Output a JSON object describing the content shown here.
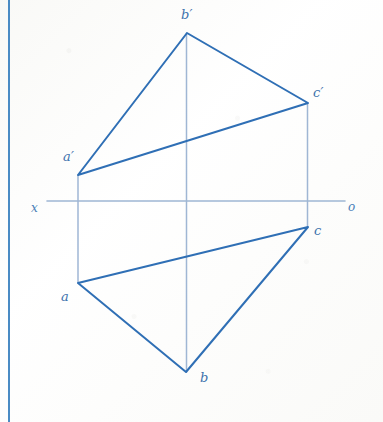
{
  "drawing": {
    "title": "Orthographic projection of triangle ABC",
    "background_color": "#fdfdfc",
    "stroke_color": "#2f6fb5",
    "light_stroke_color": "#9fb6d4",
    "margin_line_color": "#4a8bc4",
    "label_color": "#3d72ad"
  },
  "margin": {
    "line": {
      "x": 9,
      "y1": 0,
      "y2": 422,
      "width": 2,
      "color": "#4a8bc4"
    }
  },
  "axis": {
    "name": "ground-line",
    "x1": 47,
    "y1": 201,
    "x2": 345,
    "y2": 201,
    "color": "#9fb6d4",
    "width": 1.6,
    "left_label": "x",
    "right_label": "o",
    "left_label_pos": {
      "x": 31,
      "y": 202
    },
    "right_label_pos": {
      "x": 348,
      "y": 201
    }
  },
  "front_view": {
    "name": "front-view-triangle",
    "points": "78,175 187,33 308,103",
    "vertices": [
      {
        "id": "a-prime",
        "label": "a′",
        "x": 78,
        "y": 175,
        "label_x": 63,
        "label_y": 150
      },
      {
        "id": "b-prime",
        "label": "b′",
        "x": 187,
        "y": 33,
        "label_x": 181,
        "label_y": 8
      },
      {
        "id": "c-prime",
        "label": "c′",
        "x": 308,
        "y": 103,
        "label_x": 313,
        "label_y": 86
      }
    ]
  },
  "top_view": {
    "name": "top-view-triangle",
    "points": "78,283 186,372 308,227",
    "vertices": [
      {
        "id": "a",
        "label": "a",
        "x": 78,
        "y": 283,
        "label_x": 61,
        "label_y": 290
      },
      {
        "id": "b",
        "label": "b",
        "x": 186,
        "y": 372,
        "label_x": 200,
        "label_y": 371
      },
      {
        "id": "c",
        "label": "c",
        "x": 308,
        "y": 227,
        "label_x": 314,
        "label_y": 224
      }
    ]
  },
  "projection_lines": [
    {
      "id": "projector-a",
      "x": 78,
      "y1": 175,
      "y2": 283
    },
    {
      "id": "projector-b",
      "x": 186.5,
      "y1": 33,
      "y2": 372
    },
    {
      "id": "projector-c",
      "x": 307.5,
      "y1": 103,
      "y2": 227
    }
  ]
}
